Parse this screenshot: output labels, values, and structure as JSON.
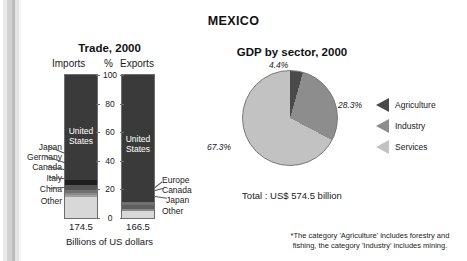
{
  "page": {
    "country_title": "MEXICO"
  },
  "trade": {
    "title": "Trade, 2000",
    "col_imports": "Imports",
    "col_percent": "%",
    "col_exports": "Exports",
    "axis_caption": "Billions of US dollars",
    "axis_ticks": [
      "100",
      "80",
      "60",
      "40",
      "20",
      "0"
    ],
    "imports_total": "174.5",
    "exports_total": "166.5",
    "imports_inside_label": "United\nStates",
    "exports_inside_label": "United\nStates",
    "imports_labels": [
      "Japan",
      "Germany",
      "Canada",
      "Italy",
      "China",
      "Other"
    ],
    "exports_labels": [
      "Europe",
      "Canada",
      "Japan",
      "Other"
    ]
  },
  "gdp": {
    "title": "GDP by sector, 2000",
    "total": "Total : US$ 574.5 billion",
    "pct_agriculture": "4.4%",
    "pct_industry": "28.3%",
    "pct_services": "67.3%"
  },
  "legend": {
    "items": [
      {
        "label": "Agriculture",
        "color": "#4a4a4a"
      },
      {
        "label": "Industry",
        "color": "#8d8d8d"
      },
      {
        "label": "Services",
        "color": "#c2c2c2"
      }
    ]
  },
  "footnote": {
    "line1": "*The category 'Agriculture' includes forestry and",
    "line2": "fishing, the category 'Industry' includes mining."
  },
  "chart_data": [
    {
      "type": "bar",
      "subtype": "stacked-100-percent",
      "title": "Trade, 2000",
      "xlabel": "Billions of US dollars",
      "ylabel": "%",
      "ylim": [
        0,
        100
      ],
      "yticks": [
        0,
        20,
        40,
        60,
        80,
        100
      ],
      "grid": false,
      "legend": "inline-callouts",
      "categories": [
        "Imports",
        "Exports"
      ],
      "category_totals": [
        174.5,
        166.5
      ],
      "category_totals_units": "Billions of US dollars",
      "series": [
        {
          "name": "United States",
          "values": [
            73.1,
            88.6
          ],
          "color": "#3a3a3a"
        },
        {
          "name": "Japan",
          "values": [
            3.7,
            null
          ],
          "color": "#1f1f1f"
        },
        {
          "name": "Germany",
          "values": [
            3.4,
            null
          ],
          "color": "#565656"
        },
        {
          "name": "Canada",
          "values": [
            2.2,
            2.0
          ],
          "color": "#707070"
        },
        {
          "name": "Italy",
          "values": [
            1.3,
            null
          ],
          "color": "#8a8a8a"
        },
        {
          "name": "China",
          "values": [
            1.4,
            null
          ],
          "color": "#a0a0a0"
        },
        {
          "name": "Europe",
          "values": [
            null,
            3.4
          ],
          "color": "#5e5e5e"
        },
        {
          "name": "Japan (exp)",
          "values": [
            null,
            1.0
          ],
          "color": "#878787"
        },
        {
          "name": "Other",
          "values": [
            14.9,
            5.0
          ],
          "color": "#d8d8d8"
        }
      ]
    },
    {
      "type": "pie",
      "title": "GDP by sector, 2000",
      "total_label": "Total : US$ 574.5 billion",
      "total_value": 574.5,
      "total_units": "US$ billion",
      "labels": [
        "Agriculture",
        "Industry",
        "Services"
      ],
      "values": [
        4.4,
        28.3,
        67.3
      ],
      "value_labels": [
        "4.4%",
        "28.3%",
        "67.3%"
      ],
      "colors": [
        "#4a4a4a",
        "#8d8d8d",
        "#c2c2c2"
      ],
      "start_angle_deg": 0,
      "legend_position": "right",
      "note": "*The category 'Agriculture' includes forestry and fishing, the category 'Industry' includes mining."
    }
  ]
}
